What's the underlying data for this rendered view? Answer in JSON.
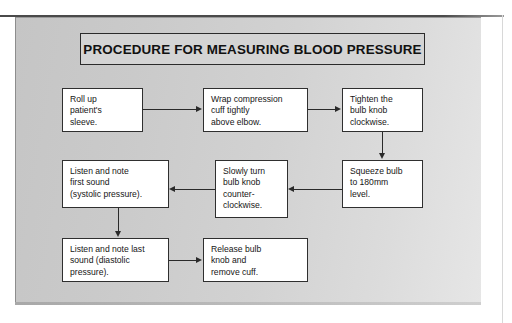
{
  "figure": {
    "title": "PROCEDURE FOR MEASURING BLOOD PRESSURE",
    "colors": {
      "panel_background": "#cacaca",
      "node_background": "#ffffff",
      "node_border": "#2f2f2f",
      "title_background": "#d4d4d4",
      "connector": "#2a2a2a",
      "text": "#161616"
    },
    "nodes": [
      {
        "id": "roll-up-sleeve",
        "lines": [
          "Roll up",
          "patient's",
          "sleeve."
        ]
      },
      {
        "id": "wrap-cuff",
        "lines": [
          "Wrap compression",
          "cuff tightly",
          "above elbow."
        ]
      },
      {
        "id": "tighten-knob",
        "lines": [
          "Tighten the",
          "bulb knob",
          "clockwise."
        ]
      },
      {
        "id": "squeeze-bulb",
        "lines": [
          "Squeeze bulb",
          "to 180mm",
          "level."
        ]
      },
      {
        "id": "slowly-turn-knob",
        "lines": [
          "Slowly turn",
          "bulb knob",
          "counter-",
          "clockwise."
        ]
      },
      {
        "id": "first-sound",
        "lines": [
          "Listen and note",
          "first sound",
          "(systolic pressure)."
        ]
      },
      {
        "id": "last-sound",
        "lines": [
          "Listen and note last",
          "sound (diastolic",
          "pressure)."
        ]
      },
      {
        "id": "release-knob",
        "lines": [
          "Release bulb",
          "knob and",
          "remove cuff."
        ]
      }
    ],
    "connectors": [
      {
        "id": "roll-up-to-wrap",
        "direction": "right"
      },
      {
        "id": "wrap-to-tighten",
        "direction": "right"
      },
      {
        "id": "tighten-to-squeeze",
        "direction": "down"
      },
      {
        "id": "squeeze-to-slowly-turn",
        "direction": "left"
      },
      {
        "id": "slowly-turn-to-first-sound",
        "direction": "left"
      },
      {
        "id": "first-sound-to-last-sound",
        "direction": "down"
      },
      {
        "id": "last-sound-to-release",
        "direction": "right"
      }
    ]
  }
}
